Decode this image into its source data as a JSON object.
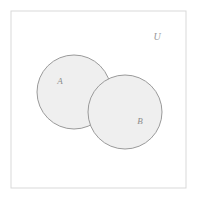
{
  "figure": {
    "type": "venn-diagram",
    "width": 197,
    "height": 200,
    "background_color": "#ffffff"
  },
  "frame": {
    "label": "universe-box",
    "x": 11,
    "y": 11,
    "width": 175,
    "height": 177,
    "fill_color": "#ffffff",
    "stroke_color": "#d9d9d9",
    "stroke_width": 1
  },
  "universe": {
    "label": "U",
    "x": 157,
    "y": 38,
    "text_color": "#9a9a9a"
  },
  "sets": [
    {
      "label": "A",
      "cx": 74,
      "cy": 92,
      "r": 37,
      "label_x": 60,
      "label_y": 82,
      "fill_color": "#efefef",
      "stroke_color": "#9a9a9a",
      "text_color": "#8c8c8c"
    },
    {
      "label": "B",
      "cx": 125,
      "cy": 112,
      "r": 37,
      "label_x": 140,
      "label_y": 122,
      "fill_color": "#efefef",
      "stroke_color": "#9a9a9a",
      "text_color": "#8c8c8c"
    }
  ]
}
